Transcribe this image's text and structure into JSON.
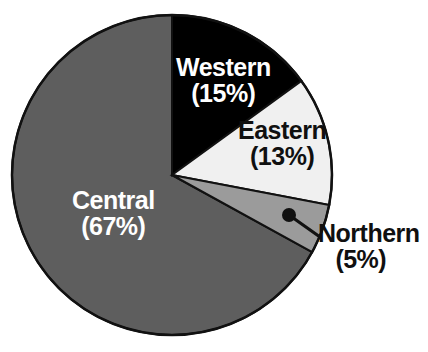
{
  "chart_data": {
    "type": "pie",
    "title": "",
    "subtitle": "",
    "xlabel": "",
    "ylabel": "",
    "legend_position": "none",
    "grid": false,
    "units": "percent",
    "start_angle_deg": 0,
    "direction": "clockwise",
    "categories": [
      "Western",
      "Eastern",
      "Northern",
      "Central"
    ],
    "values": [
      15,
      13,
      5,
      67
    ],
    "slices": [
      {
        "name": "Western",
        "value": 15,
        "percent_text": "(15%)",
        "color": "#000000",
        "label_color": "#ffffff",
        "label_placement": "inside"
      },
      {
        "name": "Eastern",
        "value": 13,
        "percent_text": "(13%)",
        "color": "#f0f0f0",
        "label_color": "#101010",
        "label_placement": "inside"
      },
      {
        "name": "Northern",
        "value": 5,
        "percent_text": "(5%)",
        "color": "#9b9b9b",
        "label_color": "#101010",
        "label_placement": "outside-callout"
      },
      {
        "name": "Central",
        "value": 67,
        "percent_text": "(67%)",
        "color": "#5e5e5e",
        "label_color": "#ffffff",
        "label_placement": "inside"
      }
    ]
  },
  "figure": {
    "background": "#ffffff",
    "outline_color": "#111111",
    "center_x": 172,
    "center_y": 175,
    "radius": 160
  },
  "labels": {
    "western": {
      "name": "Western",
      "percent": "(15%)"
    },
    "eastern": {
      "name": "Eastern",
      "percent": "(13%)"
    },
    "central": {
      "name": "Central",
      "percent": "(67%)"
    },
    "northern": {
      "name": "Northern",
      "percent": "(5%)"
    }
  },
  "callout": {
    "marker_x": 289,
    "marker_y": 215,
    "marker_radius": 6,
    "line_end_x": 320,
    "line_end_y": 237,
    "color": "#111111"
  }
}
